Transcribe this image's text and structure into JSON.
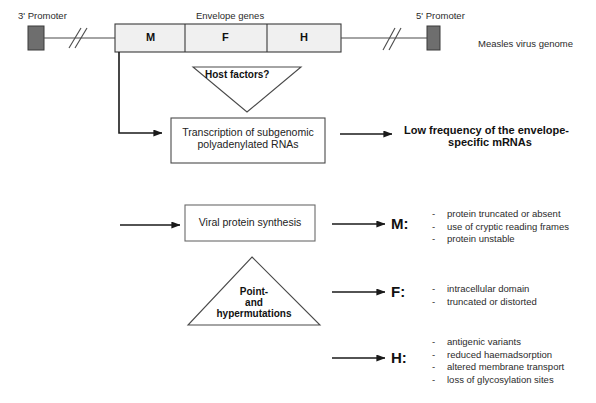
{
  "figure": {
    "genome_label": "Measles virus genome"
  },
  "genome": {
    "promoter_3_label": "3' Promoter",
    "promoter_5_label": "5' Promoter",
    "envelope_label": "Envelope genes",
    "genes": [
      {
        "name": "M"
      },
      {
        "name": "F"
      },
      {
        "name": "H"
      }
    ],
    "break_marks": 2,
    "colors": {
      "promoter_fill": "#6e6e6e",
      "gene_fill": "#f0f0f0",
      "stroke": "#3a3a3a"
    }
  },
  "host_factors": {
    "label": "Host factors?",
    "shape": "inverted-triangle"
  },
  "transcription_box": {
    "line1": "Transcription of subgenomic",
    "line2": "polyadenylated RNAs"
  },
  "outcome": {
    "line1": "Low frequency of the envelope-",
    "line2": "specific mRNAs"
  },
  "protein_box": {
    "label": "Viral protein synthesis"
  },
  "mutations_triangle": {
    "line1": "Point-",
    "line2": "and",
    "line3": "hypermutations",
    "shape": "triangle"
  },
  "proteins": [
    {
      "key": "M:",
      "items": [
        "protein truncated or absent",
        "use of cryptic reading frames",
        "protein unstable"
      ]
    },
    {
      "key": "F:",
      "items": [
        "intracellular domain",
        "truncated or distorted"
      ]
    },
    {
      "key": "H:",
      "items": [
        "antigenic variants",
        "reduced haemadsorption",
        "altered membrane transport",
        "loss of glycosylation sites"
      ]
    }
  ],
  "bullet_marker": "-"
}
